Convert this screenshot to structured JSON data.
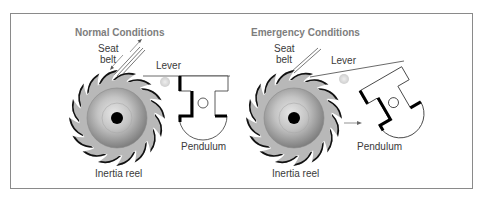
{
  "panels": [
    {
      "title": "Normal Conditions",
      "labels": {
        "seat_belt_line1": "Seat",
        "seat_belt_line2": "belt",
        "lever": "Lever",
        "pendulum": "Pendulum",
        "inertia_reel": "Inertia reel"
      },
      "state": "unlocked"
    },
    {
      "title": "Emergency Conditions",
      "labels": {
        "seat_belt_line1": "Seat",
        "seat_belt_line2": "belt",
        "lever": "Lever",
        "pendulum": "Pendulum",
        "inertia_reel": "Inertia reel"
      },
      "state": "locked"
    }
  ],
  "colors": {
    "frame": "#8a8a8a",
    "title": "#7d7d7d",
    "ratchet_fill": "#b5b5b5",
    "tooth_edge": "#111111",
    "drum_light": "#d8d8d8",
    "drum_dark": "#7a7a7a",
    "pivot": "#dcdcdc",
    "axle": "#000000"
  }
}
